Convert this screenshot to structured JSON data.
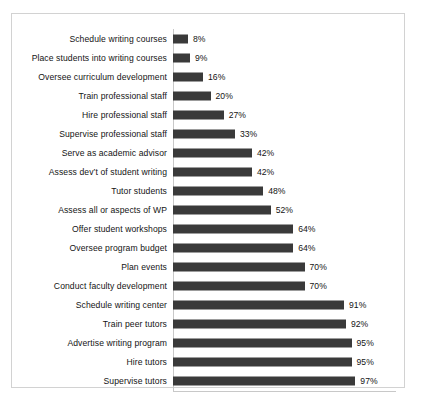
{
  "chart_data": {
    "type": "bar",
    "orientation": "horizontal",
    "title": "",
    "subtitle": "",
    "xlabel": "",
    "ylabel": "",
    "xlim": [
      0,
      100
    ],
    "grid": false,
    "legend_position": "bottom",
    "value_suffix": "%",
    "categories": [
      "Schedule writing courses",
      "Place students into writing courses",
      "Oversee curriculum development",
      "Train professional staff",
      "Hire professional staff",
      "Supervise professional staff",
      "Serve as academic advisor",
      "Assess dev’t of student writing",
      "Tutor students",
      "Assess all or aspects of WP",
      "Offer student workshops",
      "Oversee program budget",
      "Plan events",
      "Conduct faculty development",
      "Schedule writing center",
      "Train peer tutors",
      "Advertise writing program",
      "Hire tutors",
      "Supervise tutors"
    ],
    "values": [
      8,
      9,
      16,
      20,
      27,
      33,
      42,
      42,
      48,
      52,
      64,
      64,
      70,
      70,
      91,
      92,
      95,
      95,
      97
    ],
    "data_labels": [
      "8%",
      "9%",
      "16%",
      "20%",
      "27%",
      "33%",
      "42%",
      "42%",
      "48%",
      "52%",
      "64%",
      "64%",
      "70%",
      "70%",
      "91%",
      "92%",
      "95%",
      "95%",
      "97%"
    ],
    "series": [
      {
        "name": "Explicit WCD  n=64",
        "color": "#3a3a3a",
        "values": [
          8,
          9,
          16,
          20,
          27,
          33,
          42,
          42,
          48,
          52,
          64,
          64,
          70,
          70,
          91,
          92,
          95,
          95,
          97
        ]
      }
    ],
    "legend": [
      {
        "label": "Explicit WCD  n=64",
        "color": "#3a3a3a"
      }
    ]
  }
}
